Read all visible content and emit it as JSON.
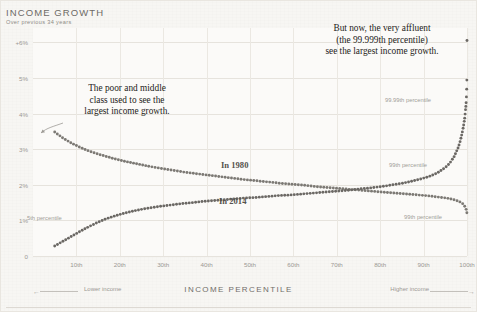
{
  "header": {
    "title": "INCOME GROWTH",
    "subtitle": "Over previous 34 years"
  },
  "footer": {
    "axis_title": "INCOME PERCENTILE",
    "lower_income": "Lower income",
    "higher_income": "Higher income",
    "arrow_left": "←",
    "arrow_right": "→"
  },
  "annotations": {
    "left_callout": "The poor and middle\nclass used to see the\nlargest income growth.",
    "right_callout": "But now, the very affluent\n(the 99.999th percentile)\nsee the largest income growth.",
    "tag_1980": "In 1980",
    "tag_2014": "In 2014",
    "pct_5th": "5th percentile",
    "pct_9999th": "99.99th percentile",
    "pct_99th_upper": "99th percentile",
    "pct_99th_lower": "99th percentile"
  },
  "colors": {
    "paper": "#f7f6f3",
    "plot_bg": "#fbfaf8",
    "gridline": "#e6e3dd",
    "series_1980": "#7c7974",
    "series_2014": "#6b6864",
    "text_muted": "#9b9893",
    "text_dark": "#1d1b19"
  },
  "chart_data": {
    "type": "line",
    "title": "INCOME GROWTH",
    "subtitle": "Over previous 34 years",
    "xlabel": "INCOME PERCENTILE",
    "ylabel": "",
    "xlim": [
      0,
      100
    ],
    "ylim": [
      0,
      6.4
    ],
    "grid": true,
    "legend_position": "inline",
    "xticks": [
      10,
      20,
      30,
      40,
      50,
      60,
      70,
      80,
      90,
      100
    ],
    "xticklabels": [
      "10th",
      "20th",
      "30th",
      "40th",
      "50th",
      "60th",
      "70th",
      "80th",
      "90th",
      "100th"
    ],
    "yticks": [
      0,
      1,
      2,
      3,
      4,
      5,
      6
    ],
    "yticklabels": [
      "0",
      "1%",
      "2%",
      "3%",
      "4%",
      "5%",
      "+6%"
    ],
    "x": [
      5,
      7,
      9,
      11,
      13,
      15,
      17,
      19,
      21,
      23,
      25,
      27,
      29,
      31,
      33,
      35,
      37,
      39,
      41,
      43,
      45,
      47,
      49,
      51,
      53,
      55,
      57,
      59,
      61,
      63,
      65,
      67,
      69,
      71,
      73,
      75,
      77,
      79,
      81,
      83,
      85,
      87,
      89,
      91,
      93,
      95,
      96,
      97,
      98,
      98.5,
      99,
      99.3,
      99.5,
      99.7,
      99.8,
      99.9,
      99.95,
      99.99,
      99.995,
      99.999
    ],
    "series": [
      {
        "name": "In 1980",
        "values": [
          3.48,
          3.3,
          3.16,
          3.04,
          2.94,
          2.86,
          2.79,
          2.72,
          2.66,
          2.61,
          2.56,
          2.51,
          2.47,
          2.43,
          2.39,
          2.35,
          2.32,
          2.29,
          2.26,
          2.23,
          2.2,
          2.17,
          2.14,
          2.12,
          2.09,
          2.07,
          2.04,
          2.02,
          2.0,
          1.98,
          1.95,
          1.93,
          1.91,
          1.89,
          1.87,
          1.85,
          1.83,
          1.81,
          1.79,
          1.77,
          1.75,
          1.73,
          1.71,
          1.69,
          1.66,
          1.63,
          1.61,
          1.58,
          1.54,
          1.51,
          1.47,
          1.43,
          1.39,
          1.34,
          1.31,
          1.26,
          1.23,
          1.19,
          1.17,
          1.15
        ]
      },
      {
        "name": "In 2014",
        "values": [
          0.28,
          0.42,
          0.56,
          0.7,
          0.83,
          0.95,
          1.05,
          1.13,
          1.2,
          1.26,
          1.31,
          1.35,
          1.39,
          1.42,
          1.45,
          1.48,
          1.5,
          1.53,
          1.55,
          1.57,
          1.59,
          1.61,
          1.63,
          1.64,
          1.66,
          1.68,
          1.7,
          1.71,
          1.73,
          1.75,
          1.77,
          1.79,
          1.81,
          1.83,
          1.85,
          1.88,
          1.9,
          1.93,
          1.96,
          2.0,
          2.04,
          2.09,
          2.15,
          2.22,
          2.32,
          2.48,
          2.6,
          2.78,
          3.05,
          3.25,
          3.52,
          3.72,
          3.9,
          4.15,
          4.3,
          4.55,
          4.75,
          5.2,
          5.6,
          6.05
        ]
      }
    ]
  }
}
